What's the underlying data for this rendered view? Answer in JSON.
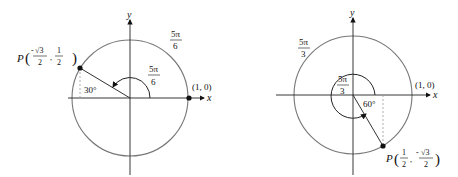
{
  "figures": [
    {
      "id": "left",
      "angle_label": {
        "num": "5π",
        "den": "6"
      },
      "arc_label": {
        "num": "5π",
        "den": "6"
      },
      "reference_angle": "30°",
      "point": {
        "name": "P",
        "x_num": "√3",
        "x_den": "2",
        "x_sign": "-",
        "y_num": "1",
        "y_den": "2",
        "y_sign": ""
      },
      "start_point": "(1, 0)",
      "axis_x": "x",
      "axis_y": "y"
    },
    {
      "id": "right",
      "angle_label": {
        "num": "5π",
        "den": "3"
      },
      "arc_label": {
        "num": "5π",
        "den": "3"
      },
      "reference_angle": "60°",
      "point": {
        "name": "P",
        "x_num": "1",
        "x_den": "2",
        "x_sign": "",
        "y_num": "√3",
        "y_den": "2",
        "y_sign": "-"
      },
      "start_point": "(1, 0)",
      "axis_x": "x",
      "axis_y": "y"
    }
  ]
}
